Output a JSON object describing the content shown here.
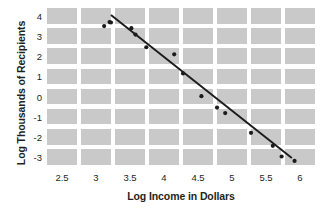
{
  "chart_data": {
    "type": "scatter",
    "title": "",
    "subtitle": "",
    "xlabel": "Log Income in Dollars",
    "ylabel": "Log Thousands of Recipients",
    "xlim": [
      2.25,
      6.25
    ],
    "ylim": [
      -3.6,
      4.4
    ],
    "xticks": [
      "2.5",
      "3",
      "3.5",
      "4",
      "4.5",
      "5",
      "5.5",
      "6"
    ],
    "xtick_values": [
      2.5,
      3,
      3.5,
      4,
      4.5,
      5,
      5.5,
      6
    ],
    "yticks": [
      "4",
      "3",
      "2",
      "1",
      "0",
      "-1",
      "-2",
      "-3"
    ],
    "ytick_values": [
      4,
      3,
      2,
      1,
      0,
      -1,
      -2,
      -3
    ],
    "grid": "banded-blocks",
    "grid_color": "#c9c9c9",
    "legend": "none",
    "point_color": "#1b1b1b",
    "line_color": "#1b1b1b",
    "series": [
      {
        "name": "observations",
        "points": [
          [
            3.12,
            3.5
          ],
          [
            3.2,
            3.7
          ],
          [
            3.22,
            3.68
          ],
          [
            3.52,
            3.4
          ],
          [
            3.58,
            3.08
          ],
          [
            3.74,
            2.45
          ],
          [
            4.15,
            2.1
          ],
          [
            4.28,
            1.15
          ],
          [
            4.55,
            0.02
          ],
          [
            4.78,
            -0.55
          ],
          [
            4.9,
            -0.82
          ],
          [
            5.28,
            -1.8
          ],
          [
            5.6,
            -2.45
          ],
          [
            5.73,
            -2.98
          ],
          [
            5.92,
            -3.2
          ]
        ]
      },
      {
        "name": "regression-line",
        "type": "line",
        "endpoints": [
          [
            3.22,
            4.05
          ],
          [
            5.88,
            -3.05
          ]
        ],
        "slope": -2.67,
        "intercept": 12.65
      }
    ]
  }
}
